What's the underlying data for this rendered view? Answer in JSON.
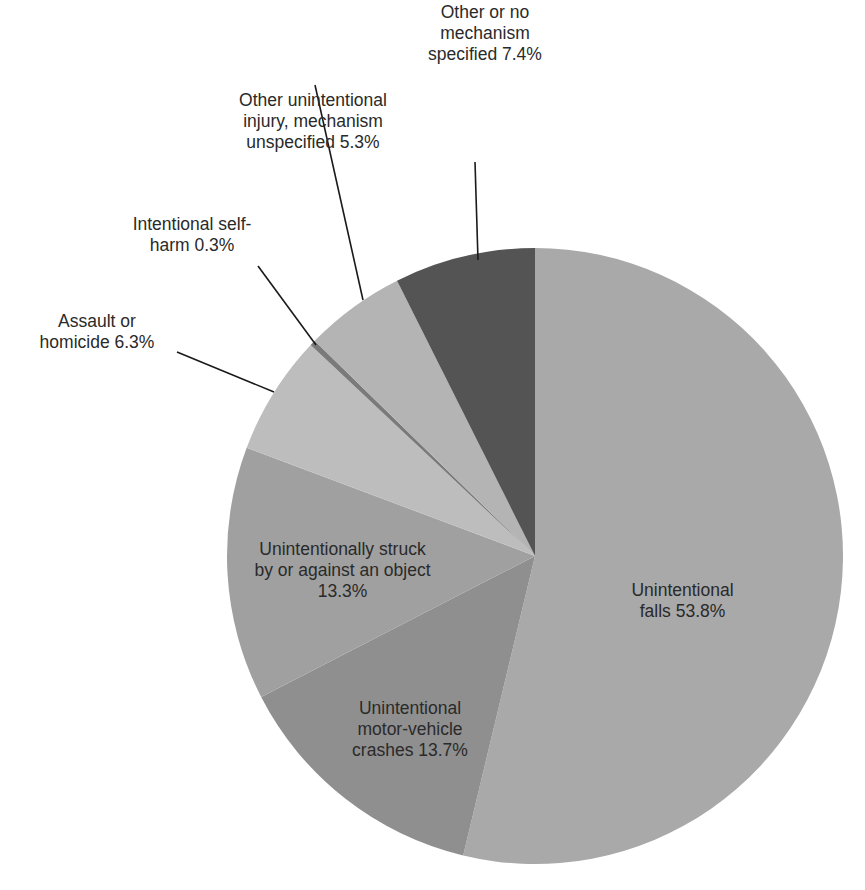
{
  "chart_data": {
    "type": "pie",
    "title": "",
    "start_angle_deg": 0,
    "direction": "clockwise",
    "slices": [
      {
        "label": "Unintentional falls",
        "value": 53.8,
        "color": "#a9a9a9",
        "text": "Unintentional\nfalls 53.8%"
      },
      {
        "label": "Unintentional motor-vehicle crashes",
        "value": 13.7,
        "color": "#8f8f8f",
        "text": "Unintentional\nmotor-vehicle\ncrashes 13.7%"
      },
      {
        "label": "Unintentionally struck by or against an object",
        "value": 13.3,
        "color": "#a0a0a0",
        "text": "Unintentionally struck\nby or against an object\n13.3%"
      },
      {
        "label": "Assault or homicide",
        "value": 6.3,
        "color": "#bdbdbd",
        "text": "Assault or\nhomicide 6.3%"
      },
      {
        "label": "Intentional self-harm",
        "value": 0.3,
        "color": "#7a7a7a",
        "text": "Intentional self-\nharm 0.3%"
      },
      {
        "label": "Other unintentional injury, mechanism unspecified",
        "value": 5.3,
        "color": "#b4b4b4",
        "text": "Other unintentional\ninjury, mechanism\nunspecified 5.3%"
      },
      {
        "label": "Other or no mechanism specified",
        "value": 7.4,
        "color": "#545454",
        "text": "Other or no\nmechanism\nspecified 7.4%"
      }
    ],
    "legend": "none"
  },
  "labels": {
    "falls": "Unintentional\nfalls 53.8%",
    "motor": "Unintentional\nmotor-vehicle\ncrashes 13.7%",
    "struck": "Unintentionally struck\nby or against an object\n13.3%",
    "assault": "Assault or\nhomicide 6.3%",
    "selfharm": "Intentional self-\nharm 0.3%",
    "otherunint": "Other unintentional\ninjury, mechanism\nunspecified 5.3%",
    "other": "Other or no\nmechanism\nspecified 7.4%"
  }
}
